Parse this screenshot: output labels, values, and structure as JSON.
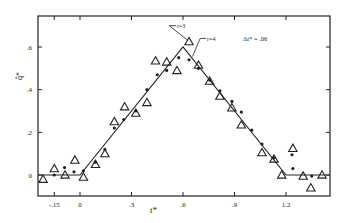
{
  "chart_data": {
    "type": "scatter",
    "title": "",
    "xlabel": "t*",
    "ylabel": "q̂*",
    "xlim": [
      -0.245,
      1.455
    ],
    "ylim": [
      -0.1,
      0.72
    ],
    "x_ticks": [
      -0.15,
      0,
      0.3,
      0.6,
      0.9,
      1.2
    ],
    "x_tick_labels": [
      "-.15",
      "0",
      ".3",
      ".6",
      ".9",
      "1.2"
    ],
    "y_ticks": [
      0,
      0.2,
      0.4,
      0.6
    ],
    "y_tick_labels": [
      "0",
      ".2",
      ".4",
      ".6"
    ],
    "grid": false,
    "annotations": [
      {
        "text": "r=3",
        "x": 0.54,
        "y": 0.7
      },
      {
        "text": "r=4",
        "x": 0.74,
        "y": 0.64
      },
      {
        "text": "Δt* = .06",
        "x": 0.95,
        "y": 0.64
      }
    ],
    "series": [
      {
        "name": "exact",
        "style": "line",
        "x": [
          -0.245,
          0,
          0.6,
          1.2,
          1.455
        ],
        "y": [
          0,
          0,
          0.6,
          0,
          0
        ]
      },
      {
        "name": "r=3",
        "style": "open-triangle",
        "x": [
          -0.215,
          -0.15,
          -0.087,
          -0.03,
          0.02,
          0.09,
          0.145,
          0.2,
          0.26,
          0.325,
          0.39,
          0.44,
          0.505,
          0.565,
          0.635,
          0.69,
          0.755,
          0.815,
          0.885,
          0.94,
          1.06,
          1.13,
          1.175,
          1.24,
          1.3,
          1.345,
          1.41
        ],
        "y": [
          -0.02,
          0.03,
          0.0,
          0.07,
          -0.01,
          0.05,
          0.1,
          0.25,
          0.32,
          0.29,
          0.34,
          0.535,
          0.53,
          0.49,
          0.625,
          0.515,
          0.44,
          0.37,
          0.315,
          0.235,
          0.105,
          0.075,
          0.0,
          0.125,
          -0.005,
          -0.06,
          0.0
        ]
      },
      {
        "name": "r=4",
        "style": "dot",
        "x": [
          -0.15,
          -0.09,
          -0.035,
          0.02,
          0.09,
          0.145,
          0.2,
          0.255,
          0.325,
          0.39,
          0.45,
          0.505,
          0.575,
          0.635,
          0.69,
          0.755,
          0.815,
          0.885,
          0.94,
          1.0,
          1.06,
          1.13,
          1.235,
          1.24,
          1.35
        ],
        "y": [
          0.0,
          0.035,
          0.015,
          0.02,
          0.06,
          0.12,
          0.22,
          0.26,
          0.3,
          0.4,
          0.47,
          0.49,
          0.55,
          0.54,
          0.5,
          0.445,
          0.395,
          0.345,
          0.295,
          0.21,
          0.145,
          0.08,
          0.095,
          0.03,
          -0.005
        ]
      }
    ]
  }
}
